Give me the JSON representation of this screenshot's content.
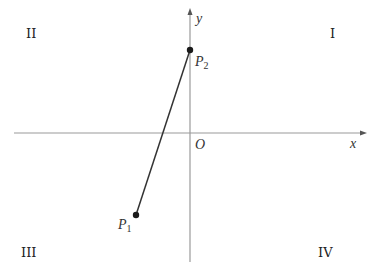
{
  "diagram": {
    "type": "cartesian-plane",
    "axes": {
      "x_label": "x",
      "y_label": "y",
      "origin_label": "O",
      "color": "#9a9a9a"
    },
    "quadrants": {
      "q1": "I",
      "q2": "II",
      "q3": "III",
      "q4": "IV"
    },
    "points": [
      {
        "name": "P",
        "subscript": "1",
        "quadrant": "III"
      },
      {
        "name": "P",
        "subscript": "2",
        "location": "positive y-axis"
      }
    ],
    "segment": {
      "from": "P1",
      "to": "P2",
      "color": "#333333"
    },
    "colors": {
      "line": "#333333",
      "point": "#1a1a1a",
      "text": "#222222"
    }
  }
}
